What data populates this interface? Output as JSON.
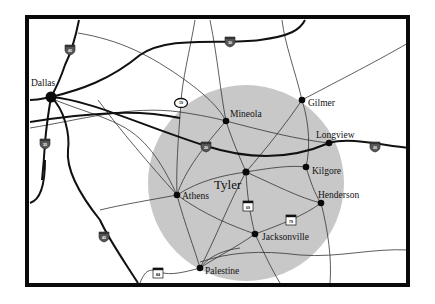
{
  "map": {
    "title": "East Texas region around Tyler",
    "colors": {
      "frame": "#0a0a0a",
      "background": "#ffffff",
      "region_circle": "#c8c8c8",
      "major_road": "#111111",
      "minor_road": "#333333",
      "city_dot": "#0a0a0a"
    },
    "region_circle": {
      "cx": 246,
      "cy": 183,
      "r": 98
    },
    "cities": [
      {
        "name": "Dallas",
        "x": 51,
        "y": 97,
        "label_x": 31,
        "label_y": 86,
        "dot_r": 5.5
      },
      {
        "name": "Mineola",
        "x": 226,
        "y": 121,
        "label_x": 230,
        "label_y": 117,
        "dot_r": 3.3
      },
      {
        "name": "Gilmer",
        "x": 302,
        "y": 100,
        "label_x": 308,
        "label_y": 106,
        "dot_r": 3.3
      },
      {
        "name": "Longview",
        "x": 329,
        "y": 143,
        "label_x": 316,
        "label_y": 138,
        "dot_r": 3.3
      },
      {
        "name": "Kilgore",
        "x": 306,
        "y": 167,
        "label_x": 312,
        "label_y": 174,
        "dot_r": 3.3
      },
      {
        "name": "Tyler",
        "x": 246,
        "y": 172,
        "label_x": 214,
        "label_y": 189,
        "dot_r": 3.6,
        "big": true
      },
      {
        "name": "Henderson",
        "x": 321,
        "y": 203,
        "label_x": 318,
        "label_y": 198,
        "dot_r": 3.3
      },
      {
        "name": "Athens",
        "x": 177,
        "y": 195,
        "label_x": 182,
        "label_y": 199,
        "dot_r": 3.3
      },
      {
        "name": "Jacksonville",
        "x": 255,
        "y": 234,
        "label_x": 262,
        "label_y": 240,
        "dot_r": 3.3
      },
      {
        "name": "Palestine",
        "x": 200,
        "y": 268,
        "label_x": 205,
        "label_y": 274,
        "dot_r": 3.3
      }
    ],
    "shields": [
      {
        "type": "interstate",
        "number": "45",
        "x": 70,
        "y": 49
      },
      {
        "type": "interstate",
        "number": "30",
        "x": 230,
        "y": 41
      },
      {
        "type": "interstate",
        "number": "35",
        "x": 45,
        "y": 143
      },
      {
        "type": "interstate",
        "number": "20",
        "x": 206,
        "y": 146
      },
      {
        "type": "interstate",
        "number": "20",
        "x": 375,
        "y": 146
      },
      {
        "type": "interstate",
        "number": "45",
        "x": 104,
        "y": 236
      },
      {
        "type": "state",
        "number": "19",
        "x": 181,
        "y": 103
      },
      {
        "type": "us",
        "number": "69",
        "x": 248,
        "y": 206
      },
      {
        "type": "us",
        "number": "79",
        "x": 291,
        "y": 220
      },
      {
        "type": "us",
        "number": "84",
        "x": 158,
        "y": 273
      }
    ]
  }
}
